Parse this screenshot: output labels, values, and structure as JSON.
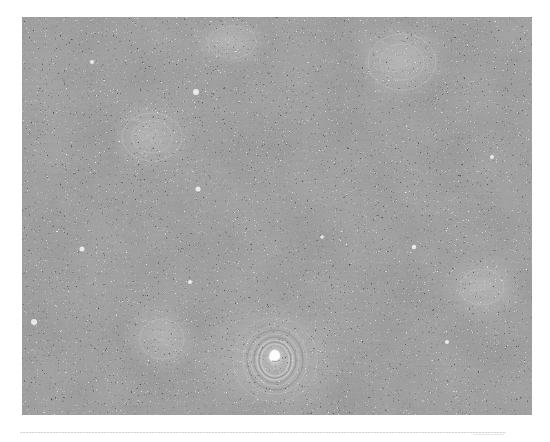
{
  "figure": {
    "type": "grayscale histology micrograph",
    "features": [
      "dense-cellular-sheets",
      "keratin-pearl-whorl",
      "scattered-whorled-nests"
    ],
    "colors": {
      "base": "#9a9a9a",
      "dark_nuclei": "#555555",
      "light": "#d8d8d8"
    }
  },
  "caption": {
    "text": " "
  }
}
